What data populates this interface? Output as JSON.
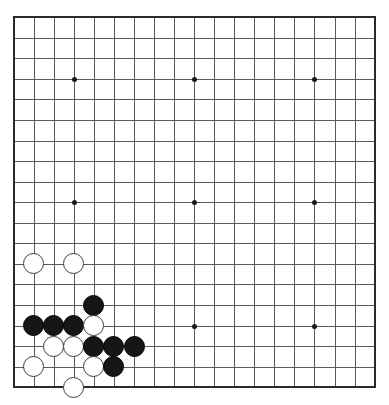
{
  "board": {
    "title": "Go board position",
    "size": 19,
    "geometry": {
      "origin_x": 13.7,
      "origin_y": 17.2,
      "spacing_x": 20.05,
      "spacing_y": 20.56,
      "stone_diameter": 21
    },
    "colors": {
      "background": "#ffffff",
      "grid_line": "#5a5a5a",
      "border_line": "#2a2a2a",
      "black_stone": "#161616",
      "white_stone": "#ffffff",
      "white_stone_edge": "#3c3c3c",
      "star_point": "#1a1a1a"
    },
    "star_points": [
      {
        "col": 3,
        "row": 3
      },
      {
        "col": 9,
        "row": 3
      },
      {
        "col": 15,
        "row": 3
      },
      {
        "col": 3,
        "row": 9
      },
      {
        "col": 9,
        "row": 9
      },
      {
        "col": 15,
        "row": 9
      },
      {
        "col": 3,
        "row": 15
      },
      {
        "col": 9,
        "row": 15
      },
      {
        "col": 15,
        "row": 15
      }
    ],
    "stones": [
      {
        "col": 1,
        "row": 12,
        "color": "white"
      },
      {
        "col": 3,
        "row": 12,
        "color": "white"
      },
      {
        "col": 4,
        "row": 14,
        "color": "black"
      },
      {
        "col": 1,
        "row": 15,
        "color": "black"
      },
      {
        "col": 2,
        "row": 15,
        "color": "black"
      },
      {
        "col": 3,
        "row": 15,
        "color": "black"
      },
      {
        "col": 4,
        "row": 15,
        "color": "white"
      },
      {
        "col": 2,
        "row": 16,
        "color": "white"
      },
      {
        "col": 3,
        "row": 16,
        "color": "white"
      },
      {
        "col": 4,
        "row": 16,
        "color": "black"
      },
      {
        "col": 5,
        "row": 16,
        "color": "black"
      },
      {
        "col": 6,
        "row": 16,
        "color": "black"
      },
      {
        "col": 1,
        "row": 17,
        "color": "white"
      },
      {
        "col": 4,
        "row": 17,
        "color": "white"
      },
      {
        "col": 5,
        "row": 17,
        "color": "black"
      },
      {
        "col": 3,
        "row": 18,
        "color": "white"
      }
    ]
  }
}
